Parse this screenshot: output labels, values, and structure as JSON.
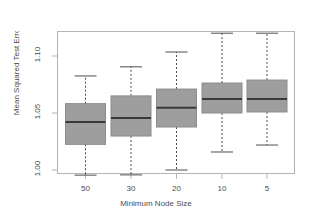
{
  "chart_data": {
    "type": "box",
    "title": "",
    "xlabel": "Minimum Node Size",
    "ylabel": "Mean Squared Test Error",
    "categories": [
      "50",
      "30",
      "20",
      "10",
      "5"
    ],
    "ylim": [
      0.992,
      1.125
    ],
    "yticks": [
      1.0,
      1.05,
      1.1
    ],
    "ytick_labels": [
      "1.00",
      "1.05",
      "1.10"
    ],
    "grid": false,
    "legend": false,
    "annotations": [
      {
        "text": "Shallow",
        "position": "top-left"
      },
      {
        "text": "Deep",
        "position": "top-right"
      }
    ],
    "box_color": "#9e9e9e",
    "line_color": "#4d4d4d",
    "boxes": [
      {
        "category": "50",
        "whisker_low": 0.9955,
        "q1": 1.0225,
        "median": 1.0422,
        "q3": 1.0582,
        "whisker_high": 1.0825
      },
      {
        "category": "30",
        "whisker_low": 0.9957,
        "q1": 1.0298,
        "median": 1.0457,
        "q3": 1.065,
        "whisker_high": 1.0905
      },
      {
        "category": "20",
        "whisker_low": 1.0,
        "q1": 1.0377,
        "median": 1.0545,
        "q3": 1.071,
        "whisker_high": 1.1035
      },
      {
        "category": "10",
        "whisker_low": 1.0158,
        "q1": 1.05,
        "median": 1.0623,
        "q3": 1.0763,
        "whisker_high": 1.12
      },
      {
        "category": "5",
        "whisker_low": 1.0219,
        "q1": 1.0509,
        "median": 1.0623,
        "q3": 1.0789,
        "whisker_high": 1.12
      }
    ]
  },
  "axes": {
    "y_tick_1": "1.00",
    "y_tick_2": "1.05",
    "y_tick_3": "1.10",
    "x_tick_1": "50",
    "x_tick_2": "30",
    "x_tick_3": "20",
    "x_tick_4": "10",
    "x_tick_5": "5",
    "x_title": "Minimum Node Size",
    "y_title": "Mean Squared Test Error"
  },
  "annotations": {
    "left": "Shallow",
    "right": "Deep"
  }
}
